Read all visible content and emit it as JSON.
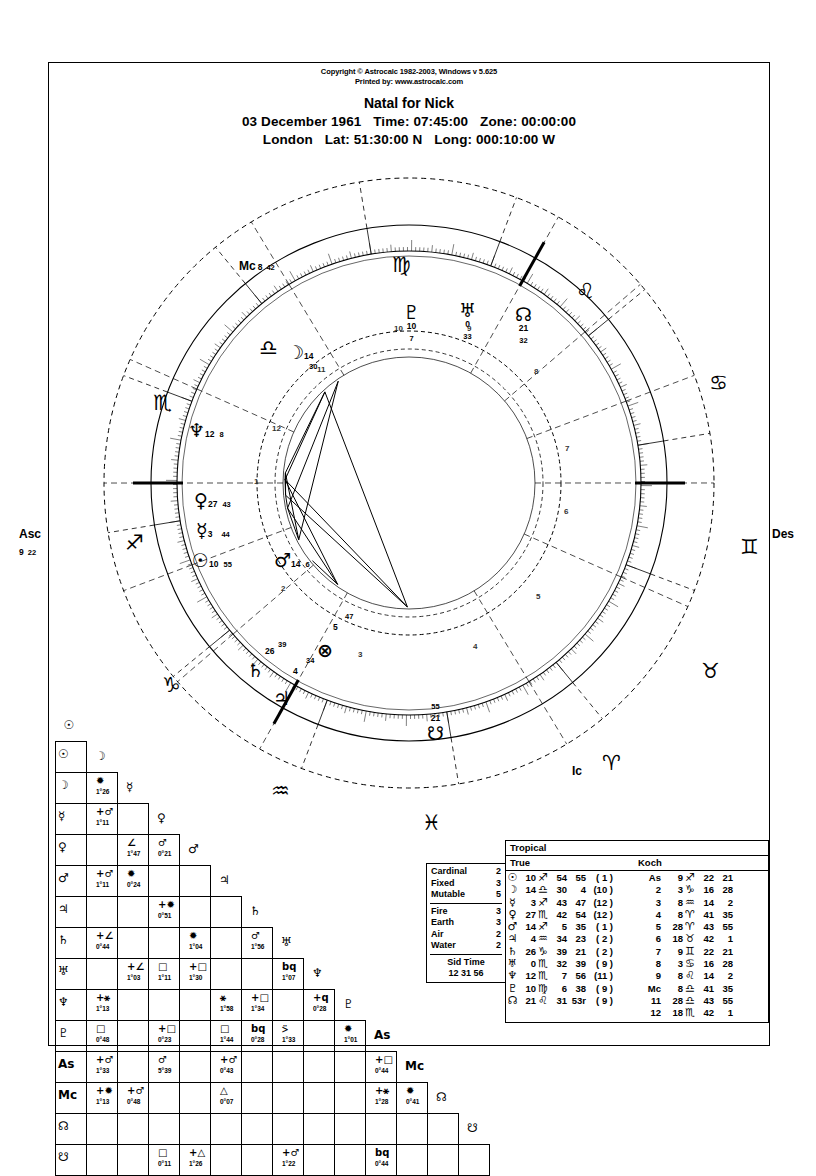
{
  "header": {
    "copyright": "Copyright © Astrocalc 1982-2003, Windows v 5.625",
    "printed_by": "Printed by: www.astrocalc.com",
    "title": "Natal for Nick",
    "date": "03 December 1961",
    "time_label": "Time: 07:45:00",
    "zone_label": "Zone: 00:00:00",
    "city": "London",
    "lat_label": "Lat: 51:30:00 N",
    "long_label": "Long: 000:10:00 W"
  },
  "wheel": {
    "axes": [
      {
        "name": "asc",
        "label": "Asc",
        "deg": "9",
        "min": "22"
      },
      {
        "name": "des",
        "label": "Des",
        "deg": "",
        "min": ""
      },
      {
        "name": "mc",
        "label": "Mc",
        "deg": "8",
        "min": "42"
      },
      {
        "name": "ic",
        "label": "Ic",
        "deg": "",
        "min": ""
      }
    ],
    "signs": [
      {
        "name": "libra",
        "glyph": "♎"
      },
      {
        "name": "virgo",
        "glyph": "♍"
      },
      {
        "name": "leo",
        "glyph": "♌"
      },
      {
        "name": "cancer",
        "glyph": "♋"
      },
      {
        "name": "gemini",
        "glyph": "♊"
      },
      {
        "name": "taurus",
        "glyph": "♉"
      },
      {
        "name": "aries",
        "glyph": "♈"
      },
      {
        "name": "pisces",
        "glyph": "♓"
      },
      {
        "name": "aquarius",
        "glyph": "♒"
      },
      {
        "name": "capricorn",
        "glyph": "♑"
      },
      {
        "name": "sagittarius",
        "glyph": "♐"
      },
      {
        "name": "scorpio",
        "glyph": "♏"
      }
    ],
    "planets": [
      {
        "name": "moon",
        "glyph": "☽",
        "deg": "14",
        "min": "30"
      },
      {
        "name": "neptune",
        "glyph": "♆",
        "deg": "12",
        "min": "8"
      },
      {
        "name": "venus",
        "glyph": "♀",
        "deg": "27",
        "min": "43"
      },
      {
        "name": "mercury",
        "glyph": "☿",
        "deg": "3",
        "min": "44"
      },
      {
        "name": "sun",
        "glyph": "☉",
        "deg": "10",
        "min": "55"
      },
      {
        "name": "mars",
        "glyph": "♂",
        "deg": "14",
        "min": "6"
      },
      {
        "name": "pluto",
        "glyph": "♇",
        "deg": "10",
        "min": "7"
      },
      {
        "name": "uranus",
        "glyph": "♅",
        "deg": "0",
        "min": "33"
      },
      {
        "name": "north-node",
        "glyph": "☊",
        "deg": "21",
        "min": "32"
      },
      {
        "name": "saturn",
        "glyph": "♄",
        "deg": "26",
        "min": "39"
      },
      {
        "name": "jupiter",
        "glyph": "♃",
        "deg": "4",
        "min": "34"
      },
      {
        "name": "part-of-fortune",
        "glyph": "⊗",
        "deg": "5",
        "min": "47"
      },
      {
        "name": "south-node",
        "glyph": "☋",
        "deg": "21",
        "min": "55"
      }
    ],
    "house_numbers": [
      "1",
      "2",
      "3",
      "4",
      "5",
      "6",
      "7",
      "8",
      "9",
      "10",
      "11",
      "12"
    ]
  },
  "aspect_grid": {
    "labels": [
      "☉",
      "☽",
      "☿",
      "♀",
      "♂",
      "♃",
      "♄",
      "♅",
      "♆",
      "♇",
      "As",
      "Mc",
      "☊",
      "☋"
    ],
    "cells": [
      {
        "r": 1,
        "c": 0,
        "asp": "✹",
        "orb": "1°26"
      },
      {
        "r": 2,
        "c": 0,
        "asp": "+♂",
        "orb": "1°11"
      },
      {
        "r": 3,
        "c": 1,
        "asp": "∠",
        "orb": "1°47"
      },
      {
        "r": 3,
        "c": 2,
        "asp": "♂",
        "orb": "0°21"
      },
      {
        "r": 4,
        "c": 0,
        "asp": "+♂",
        "orb": "1°11"
      },
      {
        "r": 4,
        "c": 1,
        "asp": "✹",
        "orb": "0°24"
      },
      {
        "r": 5,
        "c": 2,
        "asp": "+✹",
        "orb": "0°51"
      },
      {
        "r": 6,
        "c": 0,
        "asp": "+∠",
        "orb": "0°44"
      },
      {
        "r": 6,
        "c": 3,
        "asp": "✹",
        "orb": "1°04"
      },
      {
        "r": 6,
        "c": 5,
        "asp": "♂",
        "orb": "1°56"
      },
      {
        "r": 7,
        "c": 1,
        "asp": "+∠",
        "orb": "1°03"
      },
      {
        "r": 7,
        "c": 2,
        "asp": "□",
        "orb": "1°11"
      },
      {
        "r": 7,
        "c": 3,
        "asp": "+□",
        "orb": "1°30"
      },
      {
        "r": 7,
        "c": 6,
        "asp": "bq",
        "orb": "1°07"
      },
      {
        "r": 8,
        "c": 0,
        "asp": "+⚹",
        "orb": "1°13"
      },
      {
        "r": 8,
        "c": 4,
        "asp": "⚹",
        "orb": "1°58"
      },
      {
        "r": 8,
        "c": 5,
        "asp": "+□",
        "orb": "1°34"
      },
      {
        "r": 8,
        "c": 7,
        "asp": "+q",
        "orb": "0°28"
      },
      {
        "r": 9,
        "c": 0,
        "asp": "□",
        "orb": "0°48"
      },
      {
        "r": 9,
        "c": 2,
        "asp": "+□",
        "orb": "0°23"
      },
      {
        "r": 9,
        "c": 4,
        "asp": "□",
        "orb": "1°44"
      },
      {
        "r": 9,
        "c": 5,
        "asp": "bq",
        "orb": "0°28"
      },
      {
        "r": 9,
        "c": 6,
        "asp": "⍩",
        "orb": "1°33"
      },
      {
        "r": 9,
        "c": 8,
        "asp": "✹",
        "orb": "1°01"
      },
      {
        "r": 10,
        "c": 0,
        "asp": "+♂",
        "orb": "1°33"
      },
      {
        "r": 10,
        "c": 2,
        "asp": "♂",
        "orb": "5°39"
      },
      {
        "r": 10,
        "c": 4,
        "asp": "+♂",
        "orb": "0°43"
      },
      {
        "r": 10,
        "c": 9,
        "asp": "+□",
        "orb": "0°44"
      },
      {
        "r": 11,
        "c": 0,
        "asp": "+✹",
        "orb": "1°13"
      },
      {
        "r": 11,
        "c": 1,
        "asp": "+♂",
        "orb": "0°48"
      },
      {
        "r": 11,
        "c": 4,
        "asp": "△",
        "orb": "0°07"
      },
      {
        "r": 11,
        "c": 9,
        "asp": "+⚹",
        "orb": "1°28"
      },
      {
        "r": 11,
        "c": 10,
        "asp": "✹",
        "orb": "0°41"
      },
      {
        "r": 13,
        "c": 2,
        "asp": "□",
        "orb": "0°11"
      },
      {
        "r": 13,
        "c": 3,
        "asp": "+△",
        "orb": "1°26"
      },
      {
        "r": 13,
        "c": 6,
        "asp": "+♂",
        "orb": "1°22"
      },
      {
        "r": 13,
        "c": 9,
        "asp": "bq",
        "orb": "0°44"
      }
    ]
  },
  "elements": {
    "modalities": [
      {
        "label": "Cardinal",
        "value": "2"
      },
      {
        "label": "Fixed",
        "value": "3"
      },
      {
        "label": "Mutable",
        "value": "5"
      }
    ],
    "elements": [
      {
        "label": "Fire",
        "value": "3"
      },
      {
        "label": "Earth",
        "value": "3"
      },
      {
        "label": "Air",
        "value": "2"
      },
      {
        "label": "Water",
        "value": "2"
      }
    ],
    "sid_time_label": "Sid Time",
    "sid_time_value": "12 31 56"
  },
  "positions": {
    "zodiac": "Tropical",
    "node_type": "True",
    "house_system": "Koch",
    "planets": [
      {
        "glyph": "☉",
        "deg": "10",
        "sign": "♐",
        "min": "54",
        "sec": "55",
        "house": "( 1 )"
      },
      {
        "glyph": "☽",
        "deg": "14",
        "sign": "♎",
        "min": "30",
        "sec": "4",
        "house": "(10 )"
      },
      {
        "glyph": "☿",
        "deg": "3",
        "sign": "♐",
        "min": "43",
        "sec": "47",
        "house": "(12 )"
      },
      {
        "glyph": "♀",
        "deg": "27",
        "sign": "♏",
        "min": "42",
        "sec": "54",
        "house": "(12 )"
      },
      {
        "glyph": "♂",
        "deg": "14",
        "sign": "♐",
        "min": "5",
        "sec": "35",
        "house": "( 1 )"
      },
      {
        "glyph": "♃",
        "deg": "4",
        "sign": "♒",
        "min": "34",
        "sec": "23",
        "house": "( 2 )"
      },
      {
        "glyph": "♄",
        "deg": "26",
        "sign": "♑",
        "min": "39",
        "sec": "21",
        "house": "( 2 )"
      },
      {
        "glyph": "♅",
        "deg": "0",
        "sign": "♏",
        "min": "32",
        "sec": "39",
        "house": "( 9 )"
      },
      {
        "glyph": "♆",
        "deg": "12",
        "sign": "♏",
        "min": "7",
        "sec": "56",
        "house": "(11 )"
      },
      {
        "glyph": "♇",
        "deg": "10",
        "sign": "♍",
        "min": "6",
        "sec": "38",
        "house": "( 9 )"
      },
      {
        "glyph": "☊",
        "deg": "21",
        "sign": "♌",
        "min": "31",
        "sec": "53r",
        "house": "( 9 )"
      }
    ],
    "houses": [
      {
        "label": "As",
        "deg": "9",
        "sign": "♐",
        "min": "22",
        "sec": "21"
      },
      {
        "label": "2",
        "deg": "3",
        "sign": "♑",
        "min": "16",
        "sec": "28"
      },
      {
        "label": "3",
        "deg": "8",
        "sign": "♒",
        "min": "14",
        "sec": "2"
      },
      {
        "label": "4",
        "deg": "8",
        "sign": "♈",
        "min": "41",
        "sec": "35"
      },
      {
        "label": "5",
        "deg": "28",
        "sign": "♈",
        "min": "43",
        "sec": "55"
      },
      {
        "label": "6",
        "deg": "18",
        "sign": "♉",
        "min": "42",
        "sec": "1"
      },
      {
        "label": "7",
        "deg": "9",
        "sign": "♊",
        "min": "22",
        "sec": "21"
      },
      {
        "label": "8",
        "deg": "3",
        "sign": "♋",
        "min": "16",
        "sec": "28"
      },
      {
        "label": "9",
        "deg": "8",
        "sign": "♌",
        "min": "14",
        "sec": "2"
      },
      {
        "label": "Mc",
        "deg": "8",
        "sign": "♎",
        "min": "41",
        "sec": "35"
      },
      {
        "label": "11",
        "deg": "28",
        "sign": "♎",
        "min": "43",
        "sec": "55"
      },
      {
        "label": "12",
        "deg": "18",
        "sign": "♏",
        "min": "42",
        "sec": "1"
      }
    ]
  }
}
